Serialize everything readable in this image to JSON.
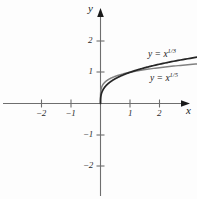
{
  "figure": {
    "background": "#fdfdfd",
    "width": 197,
    "height": 199
  },
  "axes": {
    "x_label": "x",
    "y_label": "y",
    "x_ticks": [
      {
        "value": -2,
        "label": "−2"
      },
      {
        "value": -1,
        "label": "−1"
      },
      {
        "value": 1,
        "label": "1"
      },
      {
        "value": 2,
        "label": "2"
      }
    ],
    "y_ticks": [
      {
        "value": 2,
        "label": "2"
      },
      {
        "value": 1,
        "label": "1"
      },
      {
        "value": -1,
        "label": "−1"
      },
      {
        "value": -2,
        "label": "−2"
      }
    ],
    "axis_color": "#6e6e6e",
    "arrow_color": "#1a1a1a"
  },
  "labels": {
    "curve1_base": "y = x",
    "curve1_exp": "1/3",
    "curve2_base": "y = x",
    "curve2_exp": "1/5"
  },
  "chart_data": {
    "type": "line",
    "title": "",
    "xlabel": "x",
    "ylabel": "y",
    "xlim": [
      -3.4,
      3.3
    ],
    "ylim": [
      -3.3,
      3.1
    ],
    "grid": false,
    "legend": "inline-annotations",
    "series": [
      {
        "name": "y = x^(1/3)",
        "expression": "y = x^{1/3}",
        "color": "#262626",
        "width": 1.6,
        "x": [
          -3.4,
          -3.0,
          -2.5,
          -2.0,
          -1.5,
          -1.0,
          -0.7,
          -0.4,
          -0.2,
          -0.1,
          -0.04,
          -0.01,
          0,
          0.01,
          0.04,
          0.1,
          0.2,
          0.4,
          0.7,
          1.0,
          1.5,
          2.0,
          2.5,
          3.0,
          3.3
        ],
        "y": [
          -1.504,
          -1.442,
          -1.357,
          -1.26,
          -1.145,
          -1.0,
          -0.888,
          -0.737,
          -0.585,
          -0.464,
          -0.342,
          -0.215,
          0,
          0.215,
          0.342,
          0.464,
          0.585,
          0.737,
          0.888,
          1.0,
          1.145,
          1.26,
          1.357,
          1.442,
          1.489
        ]
      },
      {
        "name": "y = x^(1/5)",
        "expression": "y = x^{1/5}",
        "color": "#808080",
        "width": 1.4,
        "x": [
          -3.4,
          -3.0,
          -2.5,
          -2.0,
          -1.5,
          -1.0,
          -0.7,
          -0.4,
          -0.2,
          -0.1,
          -0.04,
          -0.01,
          0,
          0.01,
          0.04,
          0.1,
          0.2,
          0.4,
          0.7,
          1.0,
          1.5,
          2.0,
          2.5,
          3.0,
          3.3
        ],
        "y": [
          -1.277,
          -1.246,
          -1.201,
          -1.149,
          -1.084,
          -1.0,
          -0.931,
          -0.833,
          -0.725,
          -0.631,
          -0.525,
          -0.398,
          0,
          0.398,
          0.525,
          0.631,
          0.725,
          0.833,
          0.931,
          1.0,
          1.084,
          1.149,
          1.201,
          1.246,
          1.268
        ]
      }
    ],
    "annotations": [
      {
        "text": "y = x^(1/3)",
        "x": 2.0,
        "y": 1.75
      },
      {
        "text": "y = x^(1/5)",
        "x": 2.1,
        "y": 0.85
      }
    ]
  }
}
